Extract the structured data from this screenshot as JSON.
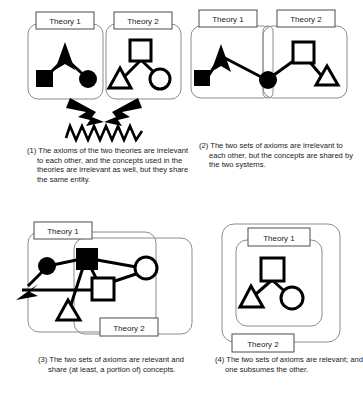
{
  "figure": {
    "title": "",
    "background": "#ffffff",
    "ink": "#000000",
    "label_text_color": "#1a1a1a"
  },
  "labels": {
    "theory1": "Theory 1",
    "theory2": "Theory 2"
  },
  "panels": [
    {
      "id": "panel-1",
      "number": "(1)",
      "relation": "disjoint-axioms-disjoint-concepts-shared-entity",
      "caption": "(1) The axioms of the two theories are irrelevant to each other, and the concepts used in the theories are irrelevant as well, but they share the same entity.",
      "caption_lines": [
        "(1) The axioms of the two",
        "theories are irrelevant to each",
        "other, and the concepts used",
        "in the theories are irrelevant as",
        "well, but they share the same",
        "entity."
      ],
      "theory1_label": "Theory 1",
      "theory2_label": "Theory 2",
      "theory1_nodes": [
        "filled-triangle",
        "filled-square",
        "filled-circle"
      ],
      "theory2_nodes": [
        "hollow-square",
        "hollow-triangle",
        "hollow-circle"
      ],
      "connector": "clash-arrowheads-and-zigzag",
      "overlap": "none"
    },
    {
      "id": "panel-2",
      "number": "(2)",
      "relation": "disjoint-axioms-shared-concepts",
      "caption": "(2) The two sets of axioms are irrelevant to each other, but the concepts are shared by the two systems.",
      "caption_lines": [
        "(2) The two sets of axioms are",
        "irrelevant to each other, but",
        "the concepts are shared by",
        "the two systems."
      ],
      "theory1_label": "Theory 1",
      "theory2_label": "Theory 2",
      "theory1_nodes": [
        "filled-triangle",
        "filled-square"
      ],
      "shared_nodes": [
        "filled-circle"
      ],
      "theory2_nodes": [
        "hollow-square",
        "hollow-triangle"
      ],
      "connector": "single-chain-through-shared-node",
      "overlap": "narrow-vertical-intersection"
    },
    {
      "id": "panel-3",
      "number": "(3)",
      "relation": "relevant-axioms-partially-shared-concepts",
      "caption": "(3) The two sets of axioms are relevant and share (at least, a portion of) concepts.",
      "caption_lines": [
        "(3) The two sets of axioms are",
        "relevant and share (at least, a",
        "portion of) concepts."
      ],
      "theory1_label": "Theory 1",
      "theory2_label": "Theory 2",
      "theory1_nodes": [
        "filled-circle",
        "filled-triangle"
      ],
      "shared_nodes": [
        "filled-square",
        "hollow-square",
        "hollow-circle",
        "hollow-triangle"
      ],
      "connector": "dense-mesh-across-boundary",
      "overlap": "large-partial-overlap"
    },
    {
      "id": "panel-4",
      "number": "(4)",
      "relation": "subsumption",
      "caption": "(4) The two sets of axioms are relevant; and one subsumes the other.",
      "caption_lines": [
        "(4) The two sets of axioms",
        "are relevant; and one",
        "subsumes the other."
      ],
      "theory1_label": "Theory 1",
      "theory2_label": "Theory 2",
      "theory1_nodes": [
        "hollow-square",
        "hollow-triangle",
        "hollow-circle"
      ],
      "theory2_nodes": [],
      "connector": "internal-tree",
      "overlap": "theory1-fully-contained-in-theory2"
    }
  ]
}
